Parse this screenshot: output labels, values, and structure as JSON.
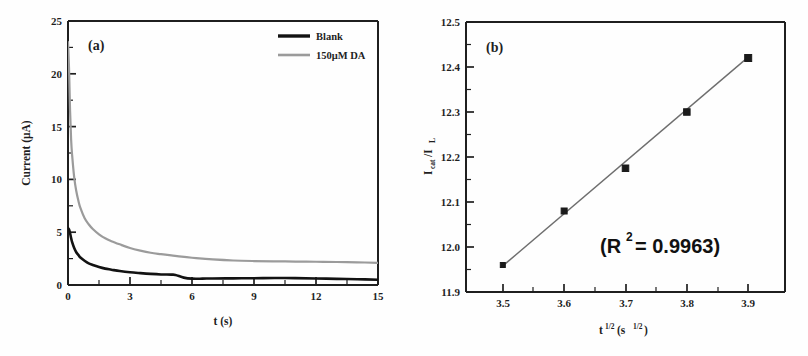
{
  "figure": {
    "background": "#fefefe",
    "panels": [
      "a",
      "b"
    ]
  },
  "panel_a": {
    "label": "(a)",
    "legend": {
      "position": "top-right",
      "entries": [
        {
          "label": "Blank",
          "color": "#121212"
        },
        {
          "label": "150μM DA",
          "color": "#9b9b9b"
        }
      ]
    },
    "xlabel": "t (s)",
    "ylabel": "Current (μA)",
    "xticks": [
      "0",
      "3",
      "6",
      "9",
      "12",
      "15"
    ],
    "yticks": [
      "0",
      "5",
      "10",
      "15",
      "20",
      "25"
    ]
  },
  "panel_b": {
    "label": "(b)",
    "annotation_prefix": "(R",
    "annotation_sup": "2",
    "annotation_suffix": "= 0.9963)",
    "xlabel_base": "t",
    "xlabel_exp": "1/2",
    "xlabel_unit_open": "(s",
    "xlabel_unit_exp": "1/2",
    "xlabel_unit_close": ")",
    "ylabel_base": "I",
    "ylabel_sub1": "cat",
    "ylabel_mid": "/I",
    "ylabel_sub2": "L",
    "xticks": [
      "3.5",
      "3.6",
      "3.7",
      "3.8",
      "3.9"
    ],
    "yticks": [
      "11.9",
      "12.0",
      "12.1",
      "12.2",
      "12.3",
      "12.4",
      "12.5"
    ]
  },
  "chart_data": [
    {
      "type": "line",
      "panel": "a",
      "title": "(a)",
      "xlabel": "t (s)",
      "ylabel": "Current (μA)",
      "xlim": [
        0,
        15
      ],
      "ylim": [
        0,
        25
      ],
      "xticks": [
        0,
        3,
        6,
        9,
        12,
        15
      ],
      "yticks": [
        0,
        5,
        10,
        15,
        20,
        25
      ],
      "grid": false,
      "legend_position": "top-right",
      "series": [
        {
          "name": "Blank",
          "color": "#121212",
          "x": [
            0.0,
            0.05,
            0.1,
            0.15,
            0.2,
            0.3,
            0.4,
            0.5,
            0.6,
            0.8,
            1.0,
            1.2,
            1.5,
            1.8,
            2.1,
            2.5,
            3.0,
            3.5,
            4.0,
            4.5,
            5.0,
            5.2,
            5.6,
            6.0,
            6.5,
            7.0,
            8.0,
            9.0,
            10.0,
            11.0,
            12.0,
            13.0,
            14.0,
            15.0
          ],
          "y": [
            5.4,
            5.25,
            4.9,
            4.45,
            4.05,
            3.5,
            3.1,
            2.85,
            2.6,
            2.3,
            2.05,
            1.9,
            1.7,
            1.55,
            1.45,
            1.32,
            1.2,
            1.12,
            1.05,
            1.0,
            0.98,
            0.95,
            0.7,
            0.6,
            0.6,
            0.62,
            0.63,
            0.64,
            0.66,
            0.65,
            0.62,
            0.58,
            0.55,
            0.5
          ]
        },
        {
          "name": "150μM DA",
          "color": "#9b9b9b",
          "x": [
            0.0,
            0.05,
            0.1,
            0.15,
            0.2,
            0.3,
            0.4,
            0.5,
            0.6,
            0.8,
            1.0,
            1.2,
            1.5,
            1.8,
            2.1,
            2.5,
            3.0,
            3.5,
            4.0,
            4.5,
            5.0,
            5.5,
            6.0,
            6.5,
            7.0,
            8.0,
            9.0,
            10.0,
            11.0,
            12.0,
            13.0,
            14.0,
            15.0
          ],
          "y": [
            23.0,
            20.5,
            16.5,
            13.8,
            12.3,
            10.2,
            8.9,
            8.0,
            7.3,
            6.35,
            5.75,
            5.3,
            4.8,
            4.42,
            4.15,
            3.85,
            3.5,
            3.25,
            3.05,
            2.92,
            2.8,
            2.68,
            2.58,
            2.5,
            2.42,
            2.32,
            2.27,
            2.24,
            2.22,
            2.2,
            2.18,
            2.15,
            2.1
          ]
        }
      ]
    },
    {
      "type": "scatter",
      "panel": "b",
      "title": "(b)",
      "xlabel": "t^1/2 (s^1/2)",
      "ylabel": "I_cat / I_L",
      "xlim": [
        3.44,
        3.96
      ],
      "ylim": [
        11.9,
        12.5
      ],
      "xticks": [
        3.5,
        3.6,
        3.7,
        3.8,
        3.9
      ],
      "yticks": [
        11.9,
        12.0,
        12.1,
        12.2,
        12.3,
        12.4,
        12.5
      ],
      "grid": false,
      "annotation": "(R2 = 0.9963)",
      "r_squared": 0.9963,
      "marker": "square",
      "marker_color": "#1b1b1b",
      "fit_color": "#6e6e6e",
      "x": [
        3.5,
        3.6,
        3.7,
        3.8,
        3.9
      ],
      "y": [
        11.96,
        12.08,
        12.175,
        12.3,
        12.42
      ],
      "fit_line": {
        "x": [
          3.5,
          3.9
        ],
        "y": [
          11.958,
          12.422
        ]
      }
    }
  ]
}
